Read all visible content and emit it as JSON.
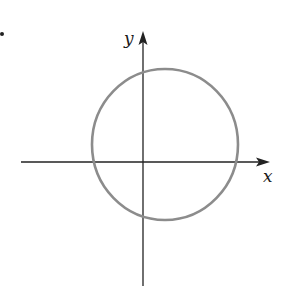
{
  "diagram": {
    "type": "coordinate-plane-circle",
    "canvas": {
      "width": 288,
      "height": 297
    },
    "colors": {
      "axis": "#222222",
      "circle": "#8c8c8c",
      "label": "#1a1a1a",
      "bullet": "#222222"
    },
    "bullet": {
      "cx": 2,
      "cy": 34,
      "r": 2
    },
    "x_axis": {
      "label": "x",
      "x1": 21,
      "y": 162,
      "x2": 270,
      "label_pos": {
        "x": 263,
        "y": 182
      }
    },
    "y_axis": {
      "label": "y",
      "x": 143,
      "y1": 286,
      "y2": 31,
      "label_pos": {
        "x": 124,
        "y": 44
      }
    },
    "circle": {
      "cx": 165,
      "cy": 144.5,
      "rx": 73,
      "ry": 75.5,
      "note": "circle centered in first quadrant-ish, offset right and up from origin, crossing both axes"
    }
  }
}
